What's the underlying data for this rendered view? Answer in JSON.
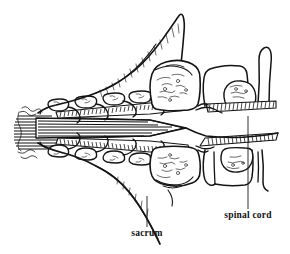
{
  "figure": {
    "kind": "anatomical-line-drawing",
    "background_color": "#ffffff",
    "ink_color": "#141414",
    "width": 290,
    "height": 254,
    "labels": [
      {
        "id": "sacrum",
        "text": "sacrum",
        "x": 147,
        "y": 236,
        "anchor": "middle",
        "leader": {
          "x1": 147,
          "y1": 196,
          "x2": 147,
          "y2": 227
        }
      },
      {
        "id": "spinal-cord",
        "text": "spinal cord",
        "x": 248,
        "y": 218,
        "anchor": "middle",
        "leader": {
          "x1": 248,
          "y1": 116,
          "x2": 248,
          "y2": 209
        }
      }
    ],
    "structures": [
      {
        "id": "spinal-cord-band",
        "name": "spinal cord",
        "note": "central horizontally striated band"
      },
      {
        "id": "cauda-equina",
        "name": "cauda equina",
        "note": "frayed nerve fibres at left margin"
      },
      {
        "id": "vertebra-chain-upper",
        "name": "upper vertebral bodies",
        "count": 5
      },
      {
        "id": "vertebra-chain-lower",
        "name": "lower vertebral bodies",
        "count": 5
      },
      {
        "id": "sacrum-upper",
        "name": "sacrum (upper mirror)"
      },
      {
        "id": "sacrum-lower",
        "name": "sacrum (lower mirror)"
      },
      {
        "id": "coccyx-upper",
        "name": "coccygeal segment (upper)"
      },
      {
        "id": "coccyx-lower",
        "name": "coccygeal segment (lower)"
      }
    ]
  }
}
